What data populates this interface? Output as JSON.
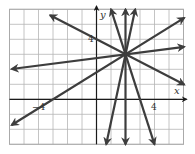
{
  "chart_data": {
    "type": "line",
    "title": "",
    "xlabel": "x",
    "ylabel": "y",
    "xlim": [
      -6,
      6
    ],
    "ylim": [
      -3,
      6
    ],
    "grid": true,
    "tick_labels": {
      "x_neg": "−4",
      "x_pos": "4",
      "y_pos": "4"
    },
    "common_point": [
      2,
      3
    ],
    "series": [
      {
        "name": "line-slope-neg-half",
        "slope": -0.5,
        "through": [
          2,
          3
        ],
        "from": [
          -3.2,
          5.6
        ],
        "to": [
          6.05,
          0.98
        ]
      },
      {
        "name": "line-slope-one-eighth",
        "slope": 0.125,
        "through": [
          2,
          3
        ],
        "from": [
          -5.85,
          2.02
        ],
        "to": [
          6.05,
          3.5
        ]
      },
      {
        "name": "line-slope-three-fifths",
        "slope": 0.6,
        "through": [
          2,
          3
        ],
        "from": [
          -5.85,
          -1.71
        ],
        "to": [
          6.05,
          5.43
        ]
      },
      {
        "name": "line-slope-neg-three",
        "slope": -3,
        "through": [
          2,
          3
        ],
        "from": [
          1.0,
          6.0
        ],
        "to": [
          4.0,
          -3.0
        ]
      },
      {
        "name": "line-slope-four-half",
        "slope": 4.5,
        "through": [
          2,
          3
        ],
        "from": [
          2.67,
          6.0
        ],
        "to": [
          0.67,
          -3.0
        ]
      },
      {
        "name": "line-vertical-x2",
        "slope": null,
        "through": [
          2,
          3
        ],
        "from": [
          2,
          6.0
        ],
        "to": [
          2,
          -3.0
        ]
      }
    ]
  },
  "colors": {
    "grid": "#b5b5b5",
    "axis": "#1a1a1a",
    "line": "#3d3d3d",
    "frame": "#aaaaaa"
  }
}
